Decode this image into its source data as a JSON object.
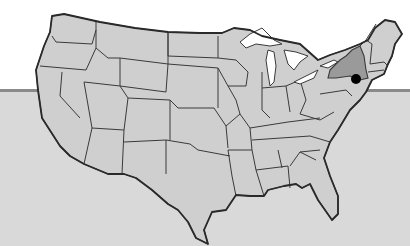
{
  "map": {
    "title": "",
    "region": "Contiguous United States",
    "highlighted_state": "New York",
    "marker": {
      "label": "New York City",
      "shape": "dot",
      "color": "#000000",
      "x": 153,
      "y": 79
    },
    "colors": {
      "background_top": "#ffffff",
      "background_bottom": "#d9d9d9",
      "band_line": "#8a8a8a",
      "state_fill": "#cfcfcf",
      "highlight_fill": "#9a9a9a",
      "border": "#3a3a3a",
      "lakes": "#ffffff"
    }
  }
}
